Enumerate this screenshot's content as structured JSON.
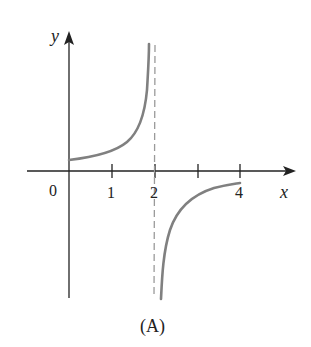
{
  "figure": {
    "caption": "(A)",
    "axes": {
      "x_label": "x",
      "y_label": "y",
      "origin_label": "0",
      "x_ticks": [
        {
          "value": 1,
          "label": "1"
        },
        {
          "value": 2,
          "label": "2"
        },
        {
          "value": 3,
          "label": ""
        },
        {
          "value": 4,
          "label": "4"
        }
      ]
    },
    "asymptote": {
      "type": "vertical",
      "x": 2,
      "style": "dashed"
    },
    "curves": [
      {
        "name": "left-branch",
        "domain": "0 ≤ x < 2",
        "behavior": "starts slightly above 0 at x=0, increases to +∞ as x→2⁻"
      },
      {
        "name": "right-branch",
        "domain": "2 < x ≤ 4",
        "behavior": "rises from −∞ as x→2⁺, approaches just below 0 at x=4"
      }
    ],
    "colors": {
      "axis": "#222222",
      "curve": "#808080",
      "asymptote": "#9a9a9a",
      "background": "#ffffff"
    }
  }
}
